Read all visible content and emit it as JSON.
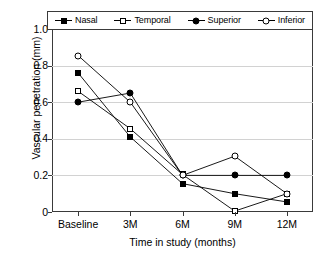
{
  "chart_data": {
    "type": "line",
    "title": "",
    "xlabel": "Time in study (months)",
    "ylabel": "Vascular penetration (mm)",
    "categories": [
      "Baseline",
      "3M",
      "6M",
      "9M",
      "12M"
    ],
    "ylim": [
      0,
      1.0
    ],
    "yticks": [
      "0",
      "0.2",
      "0.4",
      "0.6",
      "0.8",
      "1.0"
    ],
    "ytick_values": [
      0,
      0.2,
      0.4,
      0.6,
      0.8,
      1.0
    ],
    "grid": "horizontal",
    "legend_position": "top",
    "series": [
      {
        "name": "Nasal",
        "marker": "filled-square",
        "values": [
          0.76,
          0.41,
          0.155,
          0.1,
          0.055
        ]
      },
      {
        "name": "Temporal",
        "marker": "open-square",
        "values": [
          0.66,
          0.455,
          0.205,
          0.005,
          0.1
        ]
      },
      {
        "name": "Superior",
        "marker": "filled-circle",
        "values": [
          0.6,
          0.65,
          0.2,
          0.2,
          0.2
        ]
      },
      {
        "name": "Inferior",
        "marker": "open-circle",
        "values": [
          0.855,
          0.6,
          0.2,
          0.305,
          0.1
        ]
      }
    ]
  },
  "legend": {
    "entries": [
      {
        "label": "Nasal"
      },
      {
        "label": "Temporal"
      },
      {
        "label": "Superior"
      },
      {
        "label": "Inferior"
      }
    ]
  },
  "colors": {
    "series_line": "#000000",
    "frame": "#3a3a3a",
    "gridline": "#d2d2d2",
    "background": "#ffffff"
  }
}
